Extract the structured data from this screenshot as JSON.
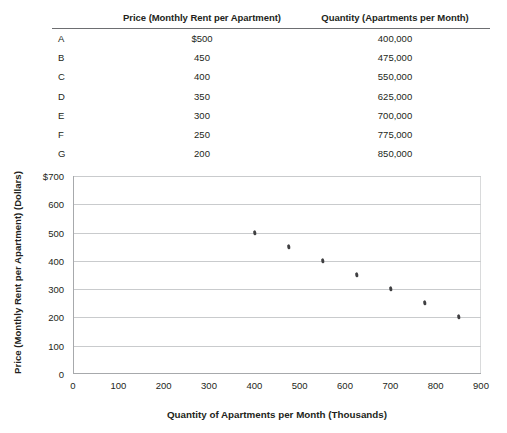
{
  "table": {
    "columns": [
      "",
      "Price (Monthly Rent per Apartment)",
      "Quantity (Apartments per Month)"
    ],
    "rows": [
      {
        "label": "A",
        "price": "$500",
        "quantity": "400,000"
      },
      {
        "label": "B",
        "price": "450",
        "quantity": "475,000"
      },
      {
        "label": "C",
        "price": "400",
        "quantity": "550,000"
      },
      {
        "label": "D",
        "price": "350",
        "quantity": "625,000"
      },
      {
        "label": "E",
        "price": "300",
        "quantity": "700,000"
      },
      {
        "label": "F",
        "price": "250",
        "quantity": "775,000"
      },
      {
        "label": "G",
        "price": "200",
        "quantity": "850,000"
      }
    ]
  },
  "chart_data": {
    "type": "scatter",
    "title": "",
    "xlabel": "Quantity of Apartments per Month (Thousands)",
    "ylabel": "Price (Monthly Rent per Apartment) (Dollars)",
    "xlim": [
      0,
      900
    ],
    "ylim": [
      0,
      700
    ],
    "xticks": [
      "0",
      "100",
      "200",
      "300",
      "400",
      "500",
      "600",
      "700",
      "800",
      "900"
    ],
    "yticks": [
      "$700",
      "600",
      "500",
      "400",
      "300",
      "200",
      "100",
      "0"
    ],
    "xtick_values": [
      0,
      100,
      200,
      300,
      400,
      500,
      600,
      700,
      800,
      900
    ],
    "ytick_values": [
      700,
      600,
      500,
      400,
      300,
      200,
      100,
      0
    ],
    "grid": "horizontal",
    "legend": "none",
    "marker_color": "#3f3f41",
    "gridline_color": "#c9cbcd",
    "axis_color": "#a7a9ac",
    "points": [
      {
        "label": "A",
        "x": 400,
        "y": 500
      },
      {
        "label": "B",
        "x": 475,
        "y": 450
      },
      {
        "label": "C",
        "x": 550,
        "y": 400
      },
      {
        "label": "D",
        "x": 625,
        "y": 350
      },
      {
        "label": "E",
        "x": 700,
        "y": 300
      },
      {
        "label": "F",
        "x": 775,
        "y": 250
      },
      {
        "label": "G",
        "x": 850,
        "y": 200
      }
    ]
  }
}
